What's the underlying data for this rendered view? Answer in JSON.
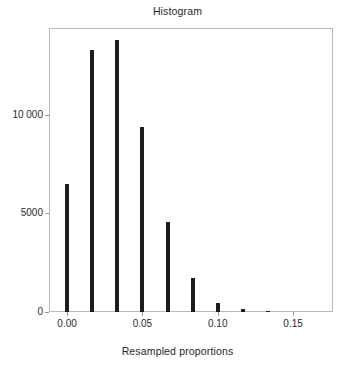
{
  "chart_data": {
    "type": "bar",
    "title": "Histogram",
    "xlabel": "Resampled proportions",
    "ylabel": "",
    "grid": false,
    "legend": null,
    "xlim": [
      -0.012,
      0.1765
    ],
    "ylim": [
      0,
      14400
    ],
    "xticks": [
      0.0,
      0.05,
      0.1,
      0.15
    ],
    "xtick_labels": [
      "0.00",
      "0.05",
      "0.10",
      "0.15"
    ],
    "yticks": [
      0,
      5000,
      10000
    ],
    "ytick_labels": [
      "0",
      "5000",
      "10 000"
    ],
    "bin_width": 0.01667,
    "bar_color": "#1c1c1c",
    "x": [
      0.0,
      0.0167,
      0.0333,
      0.05,
      0.0667,
      0.0833,
      0.1,
      0.1167,
      0.1333
    ],
    "categories": [
      "0.000",
      "0.017",
      "0.033",
      "0.050",
      "0.067",
      "0.083",
      "0.100",
      "0.117",
      "0.133"
    ],
    "values": [
      6500,
      13300,
      13800,
      9400,
      4550,
      1700,
      450,
      130,
      30
    ]
  },
  "colors": {
    "frame": "#b9b9b9",
    "tick": "#9a9a9a",
    "text": "#262626",
    "background": "#ffffff"
  }
}
